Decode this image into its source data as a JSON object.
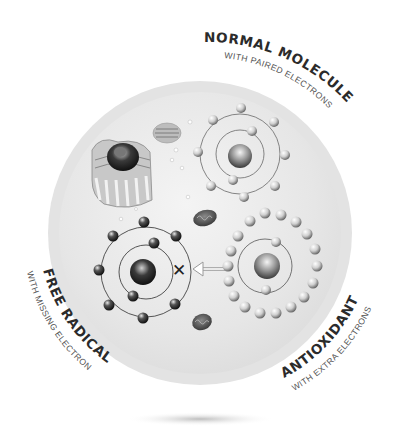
{
  "diagram": {
    "labels": {
      "normal": {
        "title": "NORMAL MOLECULE",
        "subtitle": "WITH PAIRED ELECTRONS"
      },
      "free_radical": {
        "title": "FREE RADICAL",
        "subtitle": "WITH MISSING ELECTRON"
      },
      "antioxidant": {
        "title": "ANTIOXIDANT",
        "subtitle": "WITH EXTRA ELECTRONS"
      }
    },
    "symbols": {
      "cross": "✕"
    },
    "colors": {
      "ring": "#dcdcdc",
      "disc": "#e9e9e9",
      "text_title": "#2b2b2b",
      "text_sub": "#555555"
    }
  }
}
